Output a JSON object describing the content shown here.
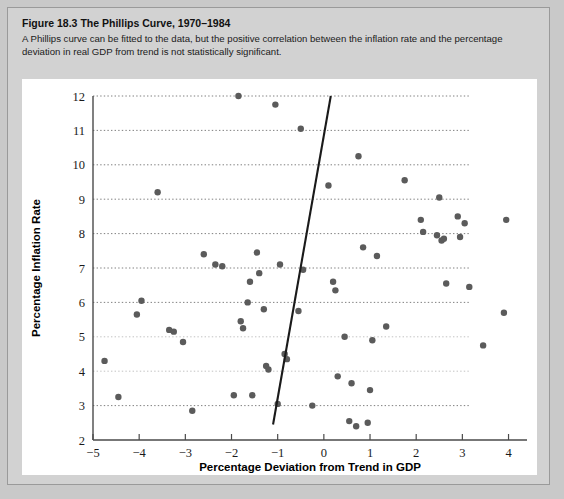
{
  "figure": {
    "number": "Figure 18.3",
    "name": "The Phillips Curve, 1970–1984",
    "description": "A Phillips curve can be fitted to the data, but the positive correlation between the inflation rate and the percentage deviation in real GDP from trend is not statistically significant."
  },
  "chart_data": {
    "type": "scatter",
    "title": "The Phillips Curve, 1970–1984",
    "xlabel": "Percentage Deviation from Trend in GDP",
    "ylabel": "Percentage Inflation Rate",
    "xlim": [
      -5,
      4.4
    ],
    "ylim": [
      2,
      12
    ],
    "xticks": [
      -5,
      -4,
      -3,
      -2,
      -1,
      0,
      1,
      2,
      3,
      4
    ],
    "xtick_labels": [
      "−5",
      "−4",
      "−3",
      "−2",
      "−1",
      "0",
      "1",
      "2",
      "3",
      "4"
    ],
    "yticks": [
      2,
      3,
      4,
      5,
      6,
      7,
      8,
      9,
      10,
      11,
      12
    ],
    "ytick_labels": [
      "2",
      "3",
      "4",
      "5",
      "6",
      "7",
      "8",
      "9",
      "10",
      "11",
      "12"
    ],
    "grid": "horizontal-dotted",
    "legend": "none",
    "marker": "filled-circle",
    "marker_color": "#5b5b5b",
    "points": [
      [
        -4.75,
        4.3
      ],
      [
        -4.45,
        3.25
      ],
      [
        -4.05,
        5.65
      ],
      [
        -3.95,
        6.05
      ],
      [
        -3.6,
        9.2
      ],
      [
        -3.35,
        5.2
      ],
      [
        -3.25,
        5.15
      ],
      [
        -3.05,
        4.85
      ],
      [
        -2.85,
        2.85
      ],
      [
        -2.6,
        7.4
      ],
      [
        -2.35,
        7.1
      ],
      [
        -2.2,
        7.05
      ],
      [
        -1.95,
        3.3
      ],
      [
        -1.85,
        12.0
      ],
      [
        -1.8,
        5.45
      ],
      [
        -1.75,
        5.25
      ],
      [
        -1.65,
        6.0
      ],
      [
        -1.6,
        6.6
      ],
      [
        -1.55,
        3.3
      ],
      [
        -1.45,
        7.45
      ],
      [
        -1.4,
        6.85
      ],
      [
        -1.3,
        5.8
      ],
      [
        -1.25,
        4.15
      ],
      [
        -1.2,
        4.05
      ],
      [
        -1.05,
        11.75
      ],
      [
        -1.0,
        3.05
      ],
      [
        -0.95,
        7.1
      ],
      [
        -0.85,
        4.5
      ],
      [
        -0.8,
        4.35
      ],
      [
        -0.55,
        5.75
      ],
      [
        -0.5,
        11.05
      ],
      [
        -0.45,
        6.95
      ],
      [
        -0.25,
        3.0
      ],
      [
        0.1,
        9.4
      ],
      [
        0.2,
        6.6
      ],
      [
        0.25,
        6.35
      ],
      [
        0.3,
        3.85
      ],
      [
        0.45,
        5.0
      ],
      [
        0.55,
        2.55
      ],
      [
        0.6,
        3.65
      ],
      [
        0.7,
        2.4
      ],
      [
        0.75,
        10.25
      ],
      [
        0.85,
        7.6
      ],
      [
        0.95,
        2.5
      ],
      [
        1.0,
        3.45
      ],
      [
        1.05,
        4.9
      ],
      [
        1.15,
        7.35
      ],
      [
        1.35,
        5.3
      ],
      [
        1.75,
        9.55
      ],
      [
        2.1,
        8.4
      ],
      [
        2.15,
        8.05
      ],
      [
        2.45,
        7.95
      ],
      [
        2.5,
        9.05
      ],
      [
        2.55,
        7.8
      ],
      [
        2.6,
        7.85
      ],
      [
        2.65,
        6.55
      ],
      [
        2.9,
        8.5
      ],
      [
        2.95,
        7.9
      ],
      [
        3.05,
        8.3
      ],
      [
        3.15,
        6.45
      ],
      [
        3.45,
        4.75
      ],
      [
        3.95,
        8.4
      ],
      [
        3.9,
        5.7
      ]
    ],
    "fit_line": {
      "label": "fitted Phillips curve",
      "x_start": -1.1,
      "y_start": 2.45,
      "x_end": 0.15,
      "y_end": 12.0
    }
  }
}
